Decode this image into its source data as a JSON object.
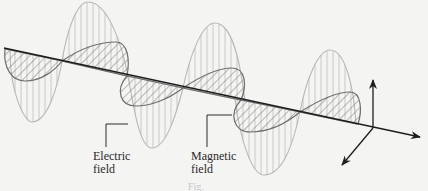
{
  "diagram": {
    "type": "electromagnetic-wave",
    "labels": {
      "electric_field_line1": "Electric",
      "electric_field_line2": "field",
      "magnetic_field_line1": "Magnetic",
      "magnetic_field_line2": "field"
    },
    "caption": "Fig.",
    "colors": {
      "background": "#f4f4f2",
      "electric_wave": "#b8b8b8",
      "magnetic_wave": "#6e6e6e",
      "axis": "#1e1e1e",
      "label_text": "#2a2a2a"
    },
    "components": {
      "propagation_axis": "direction-of-propagation",
      "electric_field_wave": "vertical-hatched-oscillation",
      "magnetic_field_wave": "diagonal-hatched-oscillation",
      "axes_icon": "3d-coordinate-axes"
    }
  }
}
